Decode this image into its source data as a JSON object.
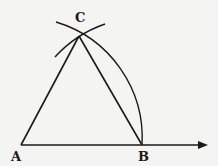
{
  "diagram": {
    "points": {
      "A": {
        "label": "A",
        "x": 21,
        "y": 145
      },
      "B": {
        "label": "B",
        "x": 142,
        "y": 145
      },
      "C": {
        "label": "C",
        "x": 79,
        "y": 36
      }
    },
    "segments": [
      "AB",
      "AC",
      "BC"
    ],
    "ray": {
      "from": "A",
      "through": "B",
      "arrow": true
    },
    "arcs": [
      {
        "center": "A",
        "radius": "AB",
        "description": "arc from B up through C"
      },
      {
        "center": "B",
        "radius": "AB",
        "description": "short arc crossing at C"
      }
    ],
    "colors": {
      "stroke": "#1a1a1a",
      "background": "#f4f4f2"
    }
  }
}
